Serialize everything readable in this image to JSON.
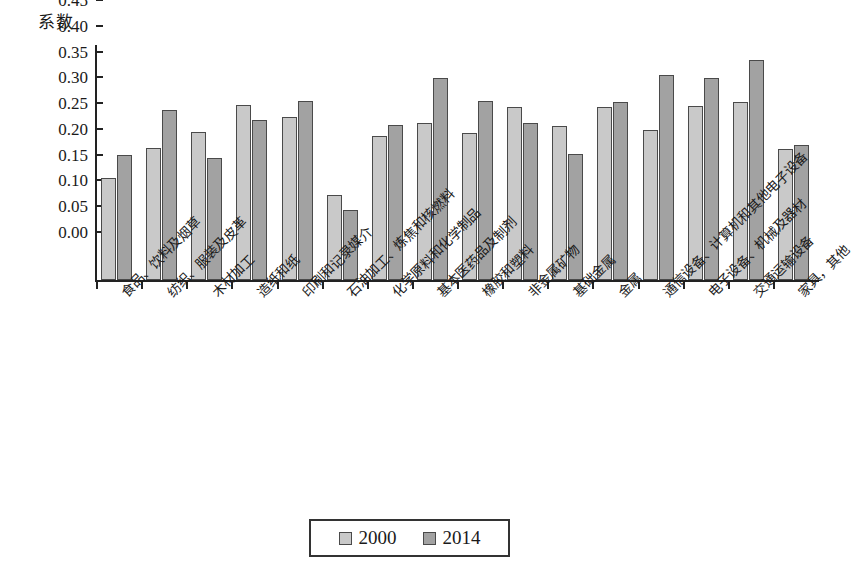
{
  "chart_data": {
    "type": "bar",
    "title": "",
    "ylabel": "系数",
    "xlabel": "",
    "ylim": [
      0,
      0.45
    ],
    "ytick_labels": [
      "0.45",
      "0.40",
      "0.35",
      "0.30",
      "0.25",
      "0.20",
      "0.15",
      "0.10",
      "0.05",
      "0.00"
    ],
    "ytick_values": [
      0.45,
      0.4,
      0.35,
      0.3,
      0.25,
      0.2,
      0.15,
      0.1,
      0.05,
      0.0
    ],
    "grid": false,
    "legend_position": "bottom-center",
    "categories": [
      "食品、饮料及烟草",
      "纺织、服装及皮革",
      "木材加工",
      "造纸和纸",
      "印刷和记录媒介",
      "石油加工、炼焦和核燃料",
      "化学原料和化学制品",
      "基本医药品及制剂",
      "橡胶和塑料",
      "非金属矿物",
      "基础金属",
      "金属",
      "通信设备、计算机和其他电子设备",
      "电子设备、机械及器材",
      "交通运输设备",
      "家具，其他"
    ],
    "series": [
      {
        "name": "2000",
        "color": "#c9c9c9",
        "values": [
          0.198,
          0.257,
          0.287,
          0.339,
          0.316,
          0.165,
          0.28,
          0.304,
          0.286,
          0.336,
          0.299,
          0.336,
          0.291,
          0.337,
          0.345,
          0.254
        ]
      },
      {
        "name": "2014",
        "color": "#a2a2a2",
        "values": [
          0.243,
          0.329,
          0.237,
          0.31,
          0.348,
          0.135,
          0.301,
          0.392,
          0.348,
          0.305,
          0.244,
          0.345,
          0.397,
          0.391,
          0.427,
          0.261
        ]
      }
    ]
  },
  "legend": {
    "items": [
      {
        "label": "2000"
      },
      {
        "label": "2014"
      }
    ]
  }
}
